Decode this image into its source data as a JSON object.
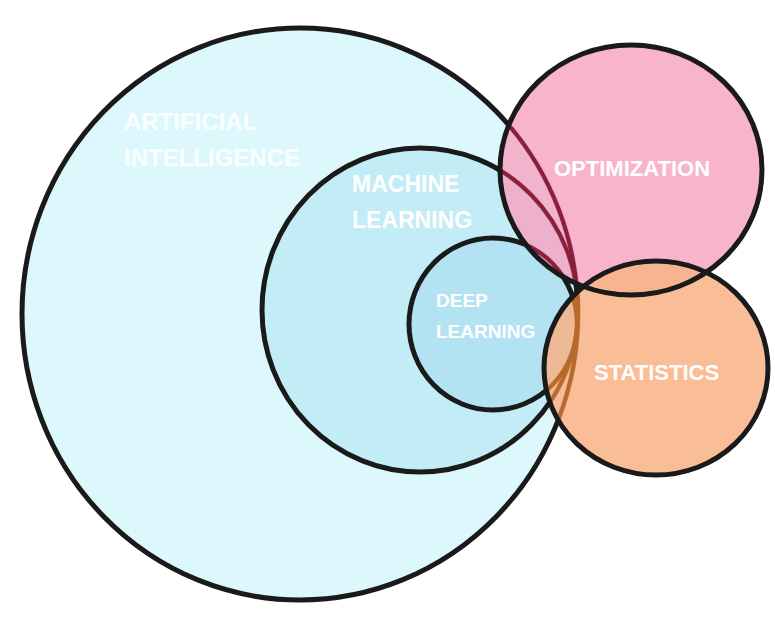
{
  "diagram": {
    "type": "venn",
    "sets": [
      {
        "id": "ai",
        "label_lines": [
          "ARTIFICIAL",
          "INTELLIGENCE"
        ],
        "fill": "#ddf8fc"
      },
      {
        "id": "ml",
        "label_lines": [
          "MACHINE",
          "LEARNING"
        ],
        "fill": "#bfeaf5"
      },
      {
        "id": "dl",
        "label_lines": [
          "DEEP",
          "LEARNING"
        ],
        "fill": "#aee0f1"
      },
      {
        "id": "opt",
        "label": "OPTIMIZATION",
        "fill": "#f5a9c4"
      },
      {
        "id": "stat",
        "label": "STATISTICS",
        "fill": "#f7b88d"
      }
    ],
    "stroke_color": "#1a1a1a",
    "inner_stroke_opt": "#8a1f3c",
    "inner_stroke_stat": "#b86a2a"
  }
}
